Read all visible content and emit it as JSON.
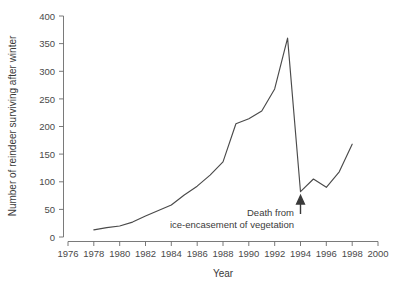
{
  "chart_data": {
    "type": "line",
    "title": "",
    "xlabel": "Year",
    "ylabel": "Number of reindeer surviving after winter",
    "xlim": [
      1976,
      2000
    ],
    "ylim": [
      0,
      400
    ],
    "xticks": [
      1976,
      1978,
      1980,
      1982,
      1984,
      1986,
      1988,
      1990,
      1992,
      1994,
      1996,
      1998,
      2000
    ],
    "xtick_labels": [
      "1976",
      "1978",
      "1980",
      "1982",
      "1984",
      "1986",
      "1988",
      "1990",
      "1992",
      "1994",
      "1996",
      "1998",
      "2000"
    ],
    "yticks": [
      0,
      50,
      100,
      150,
      200,
      250,
      300,
      350,
      400
    ],
    "ytick_labels": [
      "0",
      "50",
      "100",
      "150",
      "200",
      "250",
      "300",
      "350",
      "400"
    ],
    "grid": false,
    "legend": null,
    "series": [
      {
        "name": "Reindeer surviving after winter",
        "color": "#4a4a4a",
        "x": [
          1978,
          1979,
          1980,
          1981,
          1982,
          1983,
          1984,
          1985,
          1986,
          1987,
          1988,
          1989,
          1990,
          1991,
          1992,
          1993,
          1994,
          1995,
          1996,
          1997,
          1998
        ],
        "values": [
          13,
          17,
          20,
          27,
          38,
          48,
          58,
          76,
          92,
          112,
          136,
          205,
          214,
          228,
          268,
          360,
          82,
          105,
          90,
          118,
          168
        ]
      }
    ],
    "annotations": [
      {
        "name": "crash-annotation",
        "line1": "Death from",
        "line2": "ice-encasement of vegetation",
        "points_to_year": 1994,
        "points_to_value": 82,
        "arrow": "up-arrow"
      }
    ]
  },
  "axes": {
    "x_title": "Year",
    "y_title": "Number of reindeer surviving after winter"
  }
}
